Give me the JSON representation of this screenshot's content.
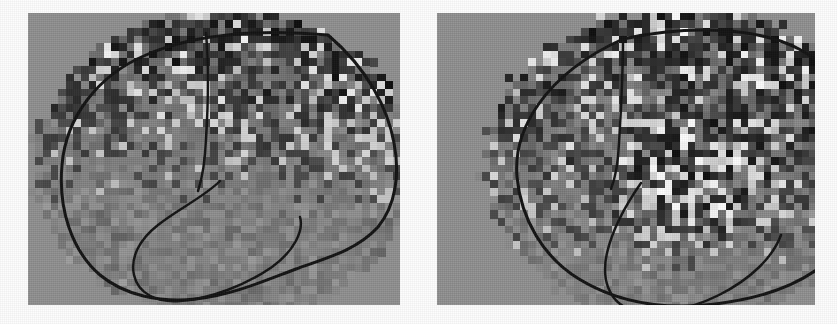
{
  "figure": {
    "kind": "statistical-parametric-map-pair",
    "modality": "functional brain activation map (grayscale voxel overlay on lateral brain outline)",
    "background_color": "#fdfdfd",
    "panel_background_color": "#8e8e8e",
    "outline_color": "#111111",
    "width": 837,
    "height": 324
  },
  "panels": [
    {
      "id": "left",
      "name": "left-brain-map",
      "label": "",
      "x": 28,
      "y": 13,
      "w": 372,
      "h": 292,
      "outline_stroke": 3.0,
      "voxel_size": 7.6,
      "brain_outline": "M 300 22 C 236 16 168 20 118 42 C 70 62 38 104 34 152 C 30 196 44 238 72 262 C 96 282 132 290 168 286 C 204 282 236 268 268 256 C 302 244 330 236 350 214 C 368 192 372 160 366 130 C 360 96 340 56 300 22 Z",
      "central_sulcus": "M 178 20 C 181 54 180 94 178 126 C 177 150 174 166 170 178",
      "sylvian_fissure": "M 192 168 C 176 184 150 196 130 212 C 112 226 102 244 106 262 C 110 280 128 290 152 288 C 182 286 218 272 244 254 C 266 238 276 218 272 204",
      "clusters_note": "dense dark/bright voxel mosaic concentrated in superior frontal, parietal and posterior regions; sparse mid-grey in inferior/temporal region"
    },
    {
      "id": "right",
      "name": "right-brain-map",
      "label": "",
      "x": 437,
      "y": 13,
      "w": 378,
      "h": 292,
      "outline_stroke": 3.0,
      "voxel_size": 7.6,
      "brain_outline": "M 186 26 C 252 12 320 14 362 36 C 400 56 420 96 424 140 C 428 186 414 230 386 252 C 356 276 312 288 268 292 C 222 296 178 288 142 266 C 106 244 84 206 80 164 C 76 118 106 62 186 26 Z",
      "central_sulcus": "M 186 24 C 186 60 184 98 182 130 C 181 152 178 166 174 176",
      "sylvian_fissure": "M 204 170 C 190 190 176 214 170 240 C 164 266 172 288 192 296 C 214 304 250 298 282 282 C 314 266 336 244 344 222",
      "clusters_note": "bright focal activation cluster just above and around the sylvian fissure in the mid/posterior region; wider dark mosaic across superior and posterior cortex"
    }
  ]
}
